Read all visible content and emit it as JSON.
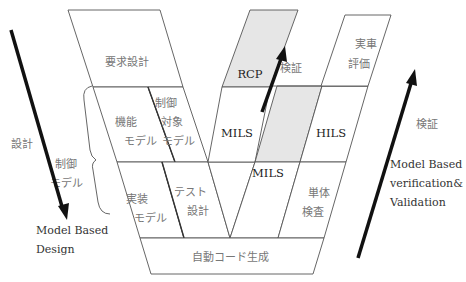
{
  "diagram": {
    "type": "V-model",
    "left_arrow": {
      "label": "設計",
      "caption_lines": [
        "Model Based",
        "Design"
      ]
    },
    "right_arrow": {
      "label": "検証",
      "caption_lines": [
        "Model Based",
        "verification&",
        "Validation"
      ]
    },
    "brace_label_lines": [
      "制御",
      "モデル"
    ],
    "blocks": {
      "requirements_design": "要求設計",
      "functional_model": [
        "機能",
        "モデル"
      ],
      "plant_model": [
        "制御",
        "対象",
        "モデル"
      ],
      "implementation_model": [
        "実装",
        "モデル"
      ],
      "test_design": [
        "テスト",
        "設計"
      ],
      "auto_code_generation": "自動コード生成",
      "rcp": "RCP",
      "mils_upper": "MILS",
      "mils_lower": "MILS",
      "hils": "HILS",
      "unit_test": [
        "単体",
        "検査"
      ],
      "vehicle_evaluation": [
        "実車",
        "評価"
      ],
      "inner_verification": "検証"
    },
    "colors": {
      "outline": "#555555",
      "shaded": "#e6e6e6",
      "arrow": "#111111",
      "jp_text": "#777777",
      "en_text": "#333333"
    }
  }
}
